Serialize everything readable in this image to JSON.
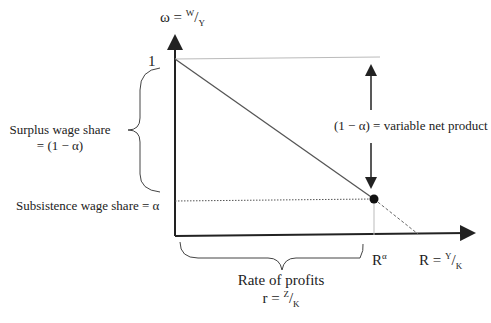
{
  "diagram": {
    "y_axis_label": {
      "lhs": "ω = ",
      "num": "W",
      "den": "Y"
    },
    "x_axis_label": {
      "lhs": "R = ",
      "num": "Y",
      "den": "K"
    },
    "y_tick_top": "1",
    "x_tick_r_alpha": {
      "base": "R",
      "sup": "α"
    },
    "surplus_label": {
      "line1": "Surplus wage share",
      "line2": "= (1 − α)"
    },
    "subsistence_label": "Subsistence wage share = α",
    "net_product_label": "(1 − α) = variable net product",
    "profits_label": {
      "line1": "Rate of profits",
      "lhs": "r = ",
      "num": "Z",
      "den": "K"
    }
  },
  "colors": {
    "ink": "#222222",
    "line": "#555555",
    "faint": "#bbbbbb"
  }
}
